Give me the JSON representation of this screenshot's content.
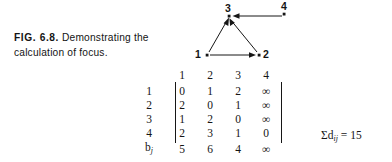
{
  "caption": {
    "figure_label": "FIG. 6.8.",
    "text": "Demonstrating the",
    "text_line2": "calculation of focus."
  },
  "graph": {
    "nodes": [
      {
        "id": "1",
        "label": "1",
        "x": 21,
        "y": 55
      },
      {
        "id": "2",
        "label": "2",
        "x": 73,
        "y": 55
      },
      {
        "id": "3",
        "label": "3",
        "x": 43,
        "y": 16
      },
      {
        "id": "4",
        "label": "4",
        "x": 98,
        "y": 14
      }
    ],
    "edges": [
      {
        "from": "1",
        "to": "2",
        "directed": true
      },
      {
        "from": "1",
        "to": "3",
        "directed": true
      },
      {
        "from": "2",
        "to": "3",
        "directed": true
      },
      {
        "from": "4",
        "to": "3",
        "directed": true
      }
    ],
    "node_color": "#161616",
    "edge_color": "#161616"
  },
  "matrix": {
    "column_headers": [
      "1",
      "2",
      "3",
      "4"
    ],
    "row_labels": [
      "1",
      "2",
      "3",
      "4"
    ],
    "rows": [
      [
        "0",
        "1",
        "2",
        "∞"
      ],
      [
        "2",
        "0",
        "1",
        "∞"
      ],
      [
        "1",
        "2",
        "0",
        "∞"
      ],
      [
        "2",
        "3",
        "1",
        "0"
      ]
    ],
    "bj_label": "b",
    "bj_subscript": "j",
    "bj_values": [
      "5",
      "6",
      "4",
      "∞"
    ]
  },
  "sum_annotation": {
    "sigma": "Σd",
    "subscript": "ij",
    "equals": " = 15"
  }
}
